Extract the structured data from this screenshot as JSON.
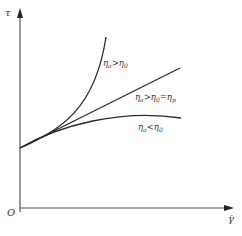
{
  "diagram": {
    "type": "rheology-flow-curves",
    "axes": {
      "y_label": "τ",
      "x_label": "γ̇",
      "origin_label": "O"
    },
    "curves": [
      {
        "name": "shear-thickening",
        "label_main": "η",
        "label_sub": "a",
        "label_rest": ">η",
        "label_sub2": "0",
        "label_tail": ""
      },
      {
        "name": "bingham",
        "label_main": "η",
        "label_sub": "a",
        "label_rest": ">η",
        "label_sub2": "0",
        "label_tail": "=η",
        "label_sub3": "p"
      },
      {
        "name": "shear-thinning",
        "label_main": "η",
        "label_sub": "a",
        "label_rest": "<η",
        "label_sub2": "0",
        "label_tail": ""
      }
    ],
    "colors": {
      "line": "#2a2a2a",
      "axis": "#555555",
      "text": "#333333"
    }
  }
}
